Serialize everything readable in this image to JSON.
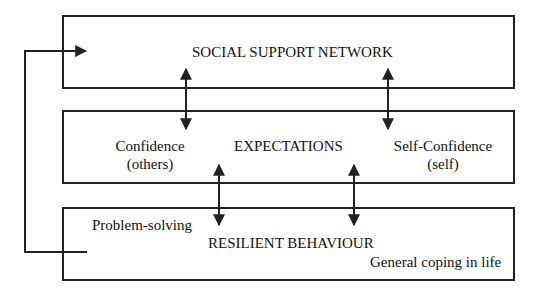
{
  "diagram": {
    "boxes": [
      {
        "id": "social",
        "title": "SOCIAL SUPPORT NETWORK"
      },
      {
        "id": "expectations",
        "title": "EXPECTATIONS",
        "left_label": [
          "Confidence",
          "(others)"
        ],
        "right_label": [
          "Self-Confidence",
          "(self)"
        ]
      },
      {
        "id": "behaviour",
        "title": "RESILIENT BEHAVIOUR",
        "left_label": "Problem-solving",
        "right_label": "General coping in life"
      }
    ],
    "connections": [
      {
        "from": "social",
        "to": "expectations",
        "type": "bidirectional",
        "count": 2
      },
      {
        "from": "expectations",
        "to": "behaviour",
        "type": "bidirectional",
        "count": 2
      },
      {
        "from": "behaviour",
        "to": "social",
        "type": "feedback-arrow"
      }
    ],
    "colors": {
      "line": "#222222",
      "background": "#ffffff"
    }
  }
}
